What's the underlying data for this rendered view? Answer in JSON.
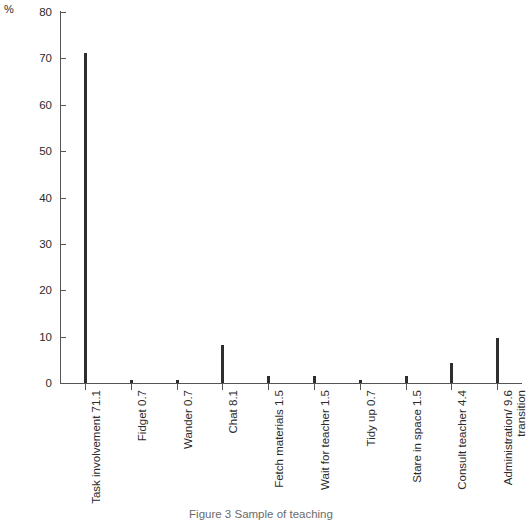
{
  "chart_data": {
    "type": "bar",
    "title": "",
    "xlabel": "",
    "ylabel": "%",
    "ylim": [
      0,
      80
    ],
    "ytick_step": 10,
    "yticks": [
      80,
      70,
      60,
      50,
      40,
      30,
      20,
      10,
      0
    ],
    "grid": false,
    "legend": null,
    "bar_color": "#2e2e2e",
    "axis_color": "#555555",
    "categories": [
      "Task involvement",
      "Fidget",
      "Wander",
      "Chat",
      "Fetch materials",
      "Wait for teacher",
      "Tidy up",
      "Stare in space",
      "Consult teacher",
      "Administration/ transition"
    ],
    "values": [
      71.1,
      0.7,
      0.7,
      8.1,
      1.5,
      1.5,
      0.7,
      1.5,
      4.4,
      9.6
    ],
    "value_labels": [
      "71.1",
      "0.7",
      "0.7",
      "8.1",
      "1.5",
      "1.5",
      "0.7",
      "1.5",
      "4.4",
      "9.6"
    ]
  },
  "axis": {
    "unit_label": "%"
  },
  "caption": {
    "text": "Figure 3  Sample of teaching"
  },
  "labels": [
    {
      "name": "Task involvement",
      "value": "71.1",
      "line2": ""
    },
    {
      "name": "Fidget",
      "value": "0.7",
      "line2": ""
    },
    {
      "name": "Wander",
      "value": "0.7",
      "line2": ""
    },
    {
      "name": "Chat",
      "value": "8.1",
      "line2": ""
    },
    {
      "name": "Fetch materials",
      "value": "1.5",
      "line2": ""
    },
    {
      "name": "Wait for teacher",
      "value": "1.5",
      "line2": ""
    },
    {
      "name": "Tidy up",
      "value": "0.7",
      "line2": ""
    },
    {
      "name": "Stare in space",
      "value": "1.5",
      "line2": ""
    },
    {
      "name": "Consult teacher",
      "value": "4.4",
      "line2": ""
    },
    {
      "name": "Administration/",
      "value": "9.6",
      "line2": "transition"
    }
  ]
}
